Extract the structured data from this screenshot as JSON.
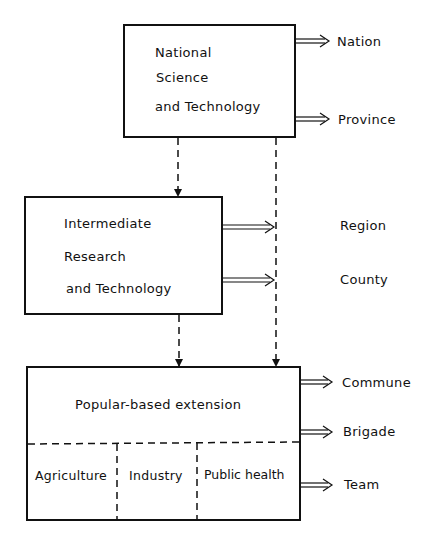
{
  "diagram": {
    "boxes": {
      "national": {
        "lines": [
          "National",
          "Science",
          "and Technology"
        ]
      },
      "intermediate": {
        "lines": [
          "Intermediate",
          "Research",
          "and Technology"
        ]
      },
      "popular": {
        "title": "Popular-based extension",
        "sections": [
          "Agriculture",
          "Industry",
          "Public health"
        ]
      }
    },
    "levels": [
      "Nation",
      "Province",
      "Region",
      "County",
      "Commune",
      "Brigade",
      "Team"
    ],
    "colors": {
      "line": "#111111",
      "background": "#ffffff"
    }
  }
}
